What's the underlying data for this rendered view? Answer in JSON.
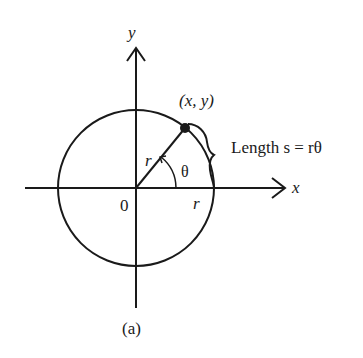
{
  "figure": {
    "caption": "(a)",
    "axes": {
      "x_label": "x",
      "y_label": "y",
      "origin_label": "0"
    },
    "circle": {
      "center": [
        136,
        188
      ],
      "radius": 78
    },
    "point": {
      "label": "(x, y)",
      "angle_deg": 51
    },
    "radius_labels": {
      "along_ray": "r",
      "along_axis": "r"
    },
    "angle_label": "θ",
    "arc_length_label": "Length s = rθ",
    "colors": {
      "stroke": "#1a1a1a",
      "background": "#ffffff"
    }
  }
}
